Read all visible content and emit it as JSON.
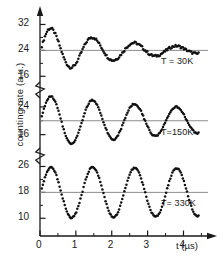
{
  "axes": {
    "ylabel": "counting rate (a.u.)",
    "xlabel": "t",
    "xunit": "(µs)",
    "xunit_full": "t (µs)",
    "xticks": [
      "0",
      "1",
      "2",
      "3",
      "4"
    ],
    "xtick_values": [
      0,
      1,
      2,
      3,
      4
    ],
    "xlim": [
      0,
      4.6
    ],
    "xminor_step": 0.5,
    "axis_color": "#1a1a1a",
    "baseline_color": "#8c8c8c",
    "data_color": "#111111"
  },
  "panels": [
    {
      "id": "panel-30k",
      "label": "T = 30K",
      "temperature_K": 30,
      "yticks": [
        "32",
        "24",
        "16"
      ],
      "ytick_values": [
        32,
        24,
        16
      ],
      "ylim": [
        13,
        34
      ],
      "baseline": 24
    },
    {
      "id": "panel-150k",
      "label": "T=150K",
      "temperature_K": 150,
      "yticks": [
        "24",
        "16"
      ],
      "ytick_values": [
        24,
        16
      ],
      "ylim": [
        11,
        28
      ],
      "baseline": 20
    },
    {
      "id": "panel-330k",
      "label": "T= 330K",
      "temperature_K": 330,
      "yticks": [
        "26",
        "18",
        "10"
      ],
      "ytick_values": [
        26,
        18,
        10
      ],
      "ylim": [
        7,
        28
      ],
      "baseline": 18
    }
  ],
  "chart_data": {
    "type": "line",
    "title": "",
    "xlabel": "t (µs)",
    "ylabel": "counting rate (a.u.)",
    "x_unit": "microseconds",
    "series": [
      {
        "name": "T = 30K",
        "panel": "panel-30k",
        "baseline": 24,
        "amplitude": 8.0,
        "frequency_MHz": 0.855,
        "period_us": 1.17,
        "phase_deg": -92,
        "damping_rate_per_us": 0.47,
        "t_start": 0.05,
        "t_end": 4.42,
        "ylim": [
          13,
          34
        ],
        "yticks": [
          32,
          24,
          16
        ]
      },
      {
        "name": "T=150K",
        "panel": "panel-150k",
        "baseline": 20,
        "amplitude": 7.6,
        "frequency_MHz": 0.855,
        "period_us": 1.17,
        "phase_deg": -92,
        "damping_rate_per_us": 0.17,
        "t_start": 0.05,
        "t_end": 4.42,
        "ylim": [
          11,
          28
        ],
        "yticks": [
          24,
          16
        ]
      },
      {
        "name": "T= 330K",
        "panel": "panel-330k",
        "baseline": 18,
        "amplitude": 8.0,
        "frequency_MHz": 0.855,
        "period_us": 1.17,
        "phase_deg": -92,
        "damping_rate_per_us": 0.02,
        "t_start": 0.05,
        "t_end": 4.42,
        "ylim": [
          7,
          28
        ],
        "yticks": [
          26,
          18,
          10
        ]
      }
    ],
    "grid": false,
    "legend": "inline-right"
  }
}
